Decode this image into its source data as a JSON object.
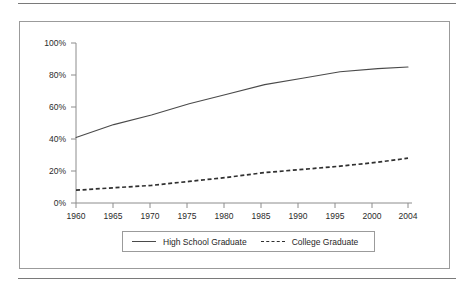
{
  "figure": {
    "has_top_rule": true,
    "has_bottom_rule": true,
    "frame_border_color": "#9b9b9b",
    "background_color": "#ffffff"
  },
  "axes": {
    "y_tick_labels": [
      "100%",
      "80%",
      "60%",
      "40%",
      "20%",
      "0%"
    ],
    "x_tick_labels": [
      "1960",
      "1965",
      "1970",
      "1975",
      "1980",
      "1985",
      "1990",
      "1995",
      "2000",
      "2004"
    ]
  },
  "legend": {
    "position": "bottom-center",
    "entries": [
      {
        "label": "High School Graduate",
        "style": "solid",
        "color": "#4a4a4a"
      },
      {
        "label": "College Graduate",
        "style": "dashed",
        "color": "#303030"
      }
    ]
  },
  "chart_data": {
    "type": "line",
    "title": "",
    "xlabel": "",
    "ylabel": "",
    "xlim": [
      1960,
      2004
    ],
    "ylim": [
      0,
      100
    ],
    "y_unit": "percent",
    "grid": false,
    "legend_position": "bottom-center",
    "x": [
      1960,
      1965,
      1970,
      1975,
      1980,
      1985,
      1990,
      1995,
      2000,
      2004
    ],
    "series": [
      {
        "name": "High School Graduate",
        "style": "solid",
        "color": "#4a4a4a",
        "values": [
          41,
          49,
          55,
          62,
          68,
          74,
          78,
          82,
          84,
          85
        ]
      },
      {
        "name": "College Graduate",
        "style": "dashed",
        "color": "#303030",
        "values": [
          8,
          9.5,
          11,
          13.5,
          16,
          19,
          21,
          23,
          25.5,
          28
        ]
      }
    ]
  }
}
